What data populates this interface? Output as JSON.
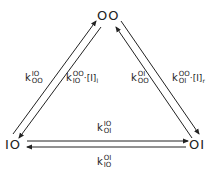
{
  "nodes": {
    "top": "OO",
    "left": "IO",
    "right": "OI"
  },
  "rates": {
    "left_outer": {
      "k": "k",
      "sup": "IO",
      "sub": "OO"
    },
    "left_inner": {
      "k": "k",
      "sup": "OO",
      "sub": "IO",
      "tail": "·[I]",
      "tail_sub": "l"
    },
    "right_inner": {
      "k": "k",
      "sup": "OI",
      "sub": "OO"
    },
    "right_outer": {
      "k": "k",
      "sup": "OO",
      "sub": "OI",
      "tail": "·[I]",
      "tail_sub": "r"
    },
    "bottom_upper": {
      "k": "k",
      "sup": "IO",
      "sub": "OI"
    },
    "bottom_lower": {
      "k": "k",
      "sup": "OI",
      "sub": "IO"
    }
  },
  "arrows": [
    {
      "from": "IO",
      "to": "OO",
      "label": "k^IO_OO"
    },
    {
      "from": "OO",
      "to": "IO",
      "label": "k^OO_IO·[I]l"
    },
    {
      "from": "OI",
      "to": "OO",
      "label": "k^OI_OO"
    },
    {
      "from": "OO",
      "to": "OI",
      "label": "k^OO_OI·[I]r"
    },
    {
      "from": "IO",
      "to": "OI",
      "label": "k^IO_OI"
    },
    {
      "from": "OI",
      "to": "IO",
      "label": "k^OI_IO"
    }
  ]
}
